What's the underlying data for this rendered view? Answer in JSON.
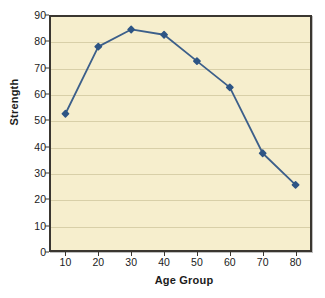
{
  "chart_data": {
    "type": "line",
    "title": "",
    "xlabel": "Age Group",
    "ylabel": "Strength",
    "x": [
      10,
      20,
      30,
      40,
      50,
      60,
      70,
      80
    ],
    "categories": [
      "10",
      "20",
      "30",
      "40",
      "50",
      "60",
      "70",
      "80"
    ],
    "values": [
      52.5,
      78,
      84.5,
      82.5,
      72.5,
      62.5,
      37.5,
      25.5
    ],
    "series": [
      {
        "name": "Strength",
        "values": [
          52.5,
          78,
          84.5,
          82.5,
          72.5,
          62.5,
          37.5,
          25.5
        ]
      }
    ],
    "xlim": [
      5,
      85
    ],
    "ylim": [
      0,
      90
    ],
    "ytick_labels": [
      "0",
      "10",
      "20",
      "30",
      "40",
      "50",
      "60",
      "70",
      "80",
      "90"
    ],
    "ytick_values": [
      0,
      10,
      20,
      30,
      40,
      50,
      60,
      70,
      80,
      90
    ],
    "xtick_labels": [
      "10",
      "20",
      "30",
      "40",
      "50",
      "60",
      "70",
      "80"
    ],
    "grid": "horizontal",
    "legend": "none",
    "marker": "square-diamond",
    "colors": {
      "line": "#3c5f8a",
      "marker": "#2e5585",
      "plot_background": "#f6eecd",
      "gridline": "#d8cfa8",
      "frame": "#3a3630",
      "text": "#1b1b1b"
    }
  }
}
